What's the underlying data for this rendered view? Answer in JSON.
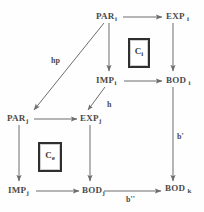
{
  "diagram": {
    "ink_color": "#4a4a4a",
    "box_border_color": "#2f2f2f",
    "background_color": "#fefefe",
    "nodes": [
      {
        "id": "par-i",
        "base": "PAR",
        "sub": "i"
      },
      {
        "id": "exp-i",
        "base": "EXP",
        "sub": "i"
      },
      {
        "id": "imp-i",
        "base": "IMP",
        "sub": "i"
      },
      {
        "id": "bod-i",
        "base": "BOD",
        "sub": "i"
      },
      {
        "id": "par-j",
        "base": "PAR",
        "sub": "j"
      },
      {
        "id": "exp-j",
        "base": "EXP",
        "sub": "j"
      },
      {
        "id": "imp-j",
        "base": "IMP",
        "sub": "j"
      },
      {
        "id": "bod-j",
        "base": "BOD",
        "sub": "j"
      },
      {
        "id": "bod-k",
        "base": "BOD",
        "sub": "k"
      }
    ],
    "boxes": [
      {
        "id": "c-i",
        "base": "C",
        "sub": "i"
      },
      {
        "id": "c-e",
        "base": "C",
        "sub": "e"
      }
    ],
    "edge_labels": [
      {
        "id": "hp",
        "text": "hp"
      },
      {
        "id": "h",
        "text": "h"
      },
      {
        "id": "b-prime",
        "text": "b'"
      },
      {
        "id": "b-double-prime",
        "text": "b''"
      }
    ]
  }
}
